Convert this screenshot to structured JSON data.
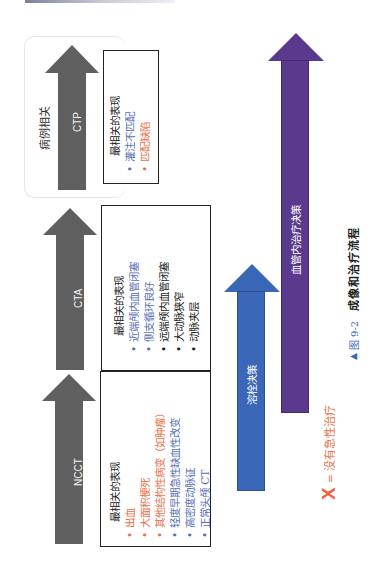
{
  "colors": {
    "gray_arrow": "#5f5f5f",
    "blue_arrow": "#3a67b8",
    "purple_arrow": "#5a3a8c",
    "orange_text": "#e8724b",
    "blue_text": "#5870b5",
    "x_mark": "#f0643c"
  },
  "stages": [
    {
      "name": "NCCT",
      "heading": "最相关的表现",
      "items": [
        {
          "text": "出血",
          "color": "orange"
        },
        {
          "text": "大面积梗死",
          "color": "orange"
        },
        {
          "text": "其他结构性病变（如肿瘤）",
          "color": "orange"
        },
        {
          "text": "轻度早期急性缺血性改变",
          "color": "blue"
        },
        {
          "text": "高密度动脉征",
          "color": "blue"
        },
        {
          "text": "正常头颅 CT",
          "color": "blue"
        }
      ]
    },
    {
      "name": "CTA",
      "heading": "最相关的表现",
      "items": [
        {
          "text": "近端颅内血管闭塞",
          "color": "blue"
        },
        {
          "text": "侧支循环良好",
          "color": "blue"
        },
        {
          "text": "远端颅内血管闭塞",
          "color": "black"
        },
        {
          "text": "大动脉狭窄",
          "color": "black"
        },
        {
          "text": "动脉夹层",
          "color": "black"
        }
      ]
    },
    {
      "name": "CTP",
      "heading": "最相关的表现",
      "items": [
        {
          "text": "灌注不匹配",
          "color": "blue"
        },
        {
          "text": "匹配缺陷",
          "color": "orange"
        }
      ],
      "bracket_label": "病例相关"
    }
  ],
  "decisions": {
    "thrombolysis": "溶栓决策",
    "endovascular": "血管内治疗决策"
  },
  "legend": {
    "mark": "X",
    "text": "= 没有急性治疗"
  },
  "caption": {
    "marker": "▲",
    "figure": "图 9-2",
    "title": "成像和治疗流程"
  }
}
